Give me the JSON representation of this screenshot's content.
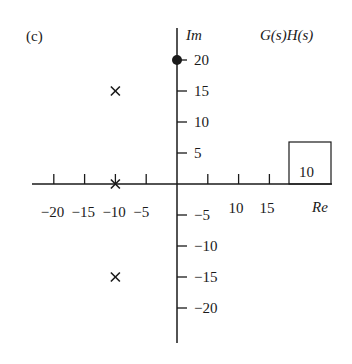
{
  "figure": {
    "panel_label": "(c)",
    "function_label": "G(s)H(s)",
    "im_axis_label": "Im",
    "re_axis_label": "Re",
    "gain_box_value": "10",
    "colors": {
      "ink": "#1a1a1a",
      "background": "#ffffff"
    }
  },
  "axes": {
    "re_ticks": [
      {
        "value": -20,
        "label": "−20"
      },
      {
        "value": -15,
        "label": "−15"
      },
      {
        "value": -10,
        "label": "−10"
      },
      {
        "value": -5,
        "label": "−5"
      },
      {
        "value": 5,
        "label": ""
      },
      {
        "value": 10,
        "label": "10"
      },
      {
        "value": 15,
        "label": "15"
      }
    ],
    "im_ticks": [
      {
        "value": 20,
        "label": "20"
      },
      {
        "value": 15,
        "label": "15"
      },
      {
        "value": 10,
        "label": "10"
      },
      {
        "value": 5,
        "label": "5"
      },
      {
        "value": -5,
        "label": "−5"
      },
      {
        "value": -10,
        "label": "−10"
      },
      {
        "value": -15,
        "label": "−15"
      },
      {
        "value": -20,
        "label": "−20"
      }
    ]
  },
  "poles": [
    {
      "re": -10,
      "im": 15
    },
    {
      "re": -10,
      "im": 0
    },
    {
      "re": -10,
      "im": -15
    }
  ],
  "zeros": [
    {
      "re": 0,
      "im": 20
    }
  ]
}
